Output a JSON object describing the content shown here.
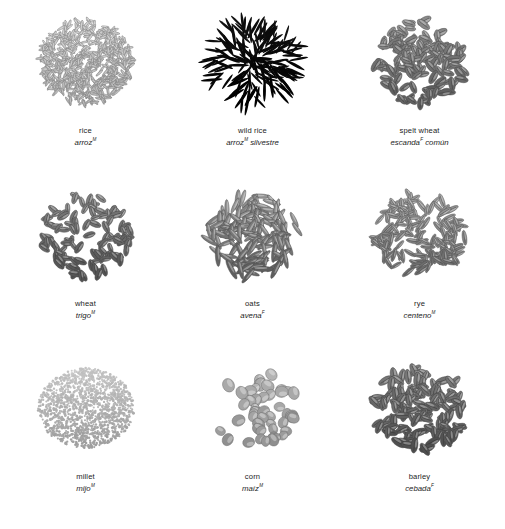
{
  "plate": {
    "columns": 3,
    "rows": 3,
    "background_color": "#ffffff",
    "text_color": "#1c1c1c",
    "palette": {
      "rice": "#d8d8d8",
      "wild_rice": "#141414",
      "spelt_wheat": "#9a9a9a",
      "wheat": "#8f8f8f",
      "oats": "#a0a0a0",
      "rye": "#adadad",
      "millet": "#cfcfcf",
      "corn": "#c2c2c2",
      "barley": "#8a8a8a"
    }
  },
  "specimens": [
    {
      "id": "rice",
      "name_en": "rice",
      "name_es": "arroz",
      "gender": "M",
      "pile_shape": "round-dense",
      "grain_form": "slender-sliver",
      "grain_count": 520,
      "grain_length": 9,
      "grain_width": 2.1,
      "tone": "#d8d8d8",
      "tone_dark": "#a7a7a7",
      "seed": 11
    },
    {
      "id": "wild-rice",
      "name_en": "wild rice",
      "name_es": "arroz",
      "name_es_suffix": "silvestre",
      "gender": "M",
      "pile_shape": "radial-scatter",
      "grain_form": "needle",
      "grain_count": 150,
      "grain_length": 20,
      "grain_width": 2.6,
      "tone": "#141414",
      "tone_dark": "#000000",
      "seed": 23
    },
    {
      "id": "spelt-wheat",
      "name_en": "spelt wheat",
      "name_es": "escanda",
      "name_es_suffix": "común",
      "gender": "F",
      "pile_shape": "round-heap",
      "grain_form": "creased-oval",
      "grain_count": 125,
      "grain_length": 13,
      "grain_width": 6,
      "tone": "#9a9a9a",
      "tone_dark": "#5d5d5d",
      "seed": 37
    },
    {
      "id": "wheat",
      "name_en": "wheat",
      "name_es": "trigo",
      "gender": "M",
      "pile_shape": "round-heap",
      "grain_form": "creased-oval",
      "grain_count": 110,
      "grain_length": 12,
      "grain_width": 5.4,
      "tone": "#8f8f8f",
      "tone_dark": "#555555",
      "seed": 47
    },
    {
      "id": "oats",
      "name_en": "oats",
      "name_es": "avena",
      "gender": "F",
      "pile_shape": "round-loose",
      "grain_form": "spindle",
      "grain_count": 135,
      "grain_length": 19,
      "grain_width": 4.4,
      "tone": "#a0a0a0",
      "tone_dark": "#5e5e5e",
      "seed": 59
    },
    {
      "id": "rye",
      "name_en": "rye",
      "name_es": "centeno",
      "gender": "M",
      "pile_shape": "round-loose",
      "grain_form": "pointed-slim",
      "grain_count": 150,
      "grain_length": 14,
      "grain_width": 4.2,
      "tone": "#adadad",
      "tone_dark": "#6c6c6c",
      "seed": 71
    },
    {
      "id": "millet",
      "name_en": "millet",
      "name_es": "mijo",
      "gender": "M",
      "pile_shape": "smooth-mound",
      "grain_form": "tiny-round",
      "grain_count": 1500,
      "grain_length": 2.4,
      "grain_width": 2.4,
      "tone": "#cfcfcf",
      "tone_dark": "#9e9e9e",
      "seed": 83
    },
    {
      "id": "corn",
      "name_en": "corn",
      "name_es": "maíz",
      "gender": "M",
      "pile_shape": "sparse-scatter",
      "grain_form": "teardrop-kernel",
      "grain_count": 48,
      "grain_length": 12,
      "grain_width": 10,
      "tone": "#c2c2c2",
      "tone_dark": "#8d8d8d",
      "seed": 97
    },
    {
      "id": "barley",
      "name_en": "barley",
      "name_es": "cebada",
      "gender": "F",
      "pile_shape": "round-dense",
      "grain_form": "plump-pointed",
      "grain_count": 135,
      "grain_length": 14,
      "grain_width": 6.2,
      "tone": "#8a8a8a",
      "tone_dark": "#4f4f4f",
      "seed": 113
    }
  ]
}
